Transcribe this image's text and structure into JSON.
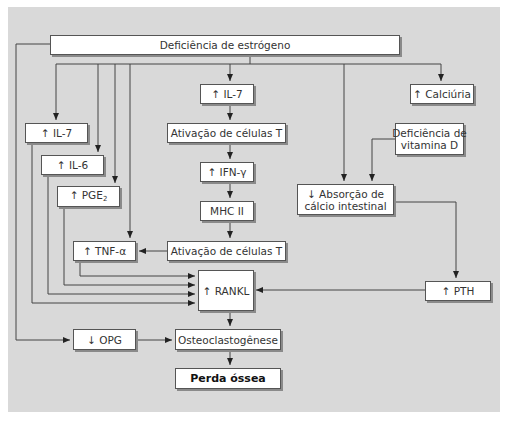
{
  "diagram": {
    "background_color": "#d9d9d9",
    "box_color": "#ffffff",
    "line_color": "#444444",
    "nodes": {
      "estrogen_deficiency": "Deficiência de estrógeno",
      "il7_center": "↑ IL-7",
      "tcell_activation_1": "Ativação de células T",
      "ifn_gamma": "↑ IFN-γ",
      "mhc2": "MHC II",
      "tcell_activation_2": "Ativação de células T",
      "rankl": "↑ RANKL",
      "osteoclastogenesis": "Osteoclastogênese",
      "bone_loss": "Perda óssea",
      "il7_left": "↑ IL-7",
      "il6": "↑ IL-6",
      "pge2_prefix": "↑ PGE",
      "pge2_sub": "2",
      "tnf_alpha": "↑ TNF-α",
      "opg": "↓ OPG",
      "calciuria": "↑ Calciúria",
      "vitd_deficiency_line1": "Deficiência de",
      "vitd_deficiency_line2": "vitamina D",
      "calcium_absorption_line1": "↓ Absorção de",
      "calcium_absorption_line2": "cálcio intestinal",
      "pth": "↑ PTH"
    },
    "edges": [
      {
        "from": "Deficiência de estrógeno",
        "to": "↑ IL-7 (center)"
      },
      {
        "from": "Deficiência de estrógeno",
        "to": "↑ IL-7 (left)"
      },
      {
        "from": "Deficiência de estrógeno",
        "to": "↑ IL-6"
      },
      {
        "from": "Deficiência de estrógeno",
        "to": "↑ PGE2"
      },
      {
        "from": "Deficiência de estrógeno",
        "to": "↑ TNF-α"
      },
      {
        "from": "Deficiência de estrógeno",
        "to": "↓ Absorção de cálcio intestinal"
      },
      {
        "from": "Deficiência de estrógeno",
        "to": "↑ Calciúria"
      },
      {
        "from": "Deficiência de estrógeno",
        "to": "↓ OPG"
      },
      {
        "from": "↑ IL-7 (center)",
        "to": "Ativação de células T"
      },
      {
        "from": "Ativação de células T",
        "to": "↑ IFN-γ"
      },
      {
        "from": "↑ IFN-γ",
        "to": "MHC II"
      },
      {
        "from": "MHC II",
        "to": "Ativação de células T (2)"
      },
      {
        "from": "Ativação de células T (2)",
        "to": "↑ TNF-α"
      },
      {
        "from": "↑ TNF-α",
        "to": "↑ RANKL"
      },
      {
        "from": "↑ PGE2",
        "to": "↑ RANKL"
      },
      {
        "from": "↑ IL-6",
        "to": "↑ RANKL"
      },
      {
        "from": "↑ IL-7 (left)",
        "to": "↑ RANKL"
      },
      {
        "from": "Deficiência de vitamina D",
        "to": "↓ Absorção de cálcio intestinal"
      },
      {
        "from": "↓ Absorção de cálcio intestinal",
        "to": "↑ PTH"
      },
      {
        "from": "↑ PTH",
        "to": "↑ RANKL"
      },
      {
        "from": "↑ RANKL",
        "to": "Osteoclastogênese"
      },
      {
        "from": "↓ OPG",
        "to": "Osteoclastogênese"
      },
      {
        "from": "Osteoclastogênese",
        "to": "Perda óssea"
      }
    ]
  }
}
